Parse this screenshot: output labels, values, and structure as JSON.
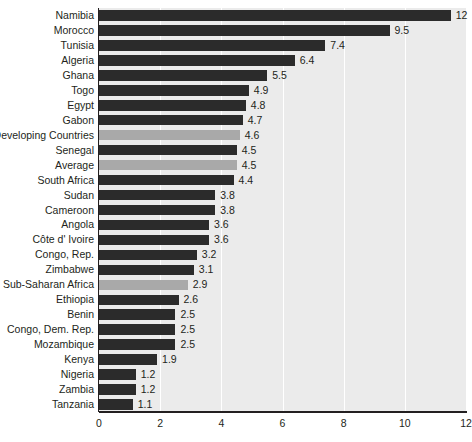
{
  "chart_data": {
    "type": "bar",
    "orientation": "horizontal",
    "title": "",
    "subtitle": "",
    "xlabel": "",
    "ylabel": "",
    "xlim": [
      0,
      12
    ],
    "xticks": [
      0,
      2,
      4,
      6,
      8,
      10,
      12
    ],
    "xtick_labels": [
      "0",
      "2",
      "4",
      "6",
      "8",
      "10",
      "12"
    ],
    "grid": true,
    "grid_axis": "x",
    "legend": null,
    "categories": [
      "Namibia",
      "Morocco",
      "Tunisia",
      "Algeria",
      "Ghana",
      "Togo",
      "Egypt",
      "Gabon",
      "Developing Countries",
      "Senegal",
      "Average",
      "South Africa",
      "Sudan",
      "Cameroon",
      "Angola",
      "Côte d' Ivoire",
      "Congo, Rep.",
      "Zimbabwe",
      "Sub-Saharan Africa",
      "Ethiopia",
      "Benin",
      "Congo, Dem. Rep.",
      "Mozambique",
      "Kenya",
      "Nigeria",
      "Zambia",
      "Tanzania"
    ],
    "values": [
      11.5,
      9.5,
      7.4,
      6.4,
      5.5,
      4.9,
      4.8,
      4.7,
      4.6,
      4.5,
      4.5,
      4.4,
      3.8,
      3.8,
      3.6,
      3.6,
      3.2,
      3.1,
      2.9,
      2.6,
      2.5,
      2.5,
      2.5,
      1.9,
      1.2,
      1.2,
      1.1
    ],
    "data_labels": [
      "12",
      "9.5",
      "7.4",
      "6.4",
      "5.5",
      "4.9",
      "4.8",
      "4.7",
      "4.6",
      "4.5",
      "4.5",
      "4.4",
      "3.8",
      "3.8",
      "3.6",
      "3.6",
      "3.2",
      "3.1",
      "2.9",
      "2.6",
      "2.5",
      "2.5",
      "2.5",
      "1.9",
      "1.2",
      "1.2",
      "1.1"
    ],
    "highlighted_categories": [
      "Developing Countries",
      "Average",
      "Sub-Saharan Africa"
    ],
    "colors": {
      "bar": "#2b2b2b",
      "bar_highlight": "#a9a9a9",
      "plot_background": "#ebebeb",
      "gridline": "#ffffff",
      "axis": "#231f20",
      "text": "#231f20",
      "page_background": "#ffffff"
    }
  }
}
